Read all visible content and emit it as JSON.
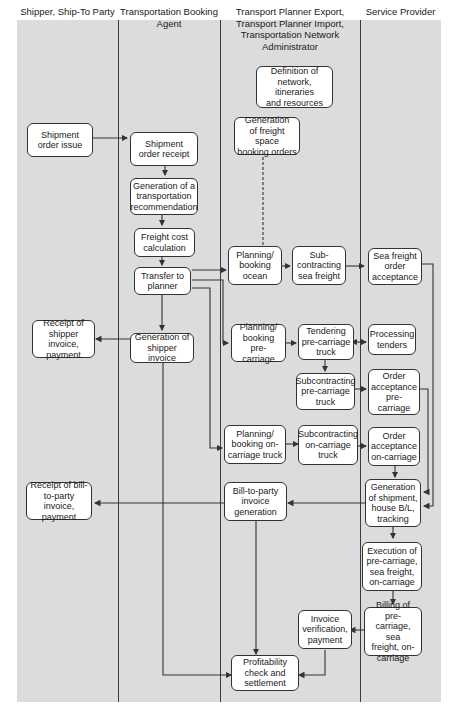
{
  "lanes": [
    {
      "id": "shipper",
      "title": "Shipper, Ship-To Party"
    },
    {
      "id": "booking_agent",
      "title": "Transportation Booking\nAgent"
    },
    {
      "id": "planner",
      "title": "Transport Planner Export,\nTransport Planner Import,\nTransportation Network Administrator"
    },
    {
      "id": "service_provider",
      "title": "Service Provider"
    }
  ],
  "nodes": {
    "definition_network": "Definition of\nnetwork, itineraries\nand resources",
    "shipment_order_issue": "Shipment\norder issue",
    "shipment_order_receipt": "Shipment\norder receipt",
    "generation_freight_space": "Generation\nof freight space\nbooking orders",
    "generation_transport_rec": "Generation of a\ntransportation\nrecommendation",
    "freight_cost_calc": "Freight cost\ncalculation",
    "transfer_to_planner": "Transfer to\nplanner",
    "planning_booking_ocean": "Planning/\nbooking\nocean",
    "subcontracting_sea": "Sub-\ncontracting\nsea freight",
    "sea_freight_acceptance": "Sea freight\norder\nacceptance",
    "receipt_shipper_invoice": "Receipt of\nshipper invoice,\npayment",
    "generation_shipper_invoice": "Generation of\nshipper invoice",
    "planning_booking_pre": "Planning/\nbooking pre-\ncarriage",
    "tendering_pre": "Tendering\npre-carriage\ntruck",
    "processing_tenders": "Processing\ntenders",
    "subcontracting_pre": "Subcontracting\npre-carriage\ntruck",
    "order_acceptance_pre": "Order\nacceptance\npre-carriage",
    "planning_booking_on": "Planning/\nbooking on-\ncarriage truck",
    "subcontracting_on": "Subcontracting\non-carriage\ntruck",
    "order_acceptance_on": "Order\nacceptance\non-carriage",
    "receipt_bill_to_party": "Receipt of bill-\nto-party invoice,\npayment",
    "bill_to_party_generation": "Bill-to-party\ninvoice\ngeneration",
    "generation_shipment_bl": "Generation\nof shipment,\nhouse B/L,\ntracking",
    "execution_carriage": "Execution of\npre-carriage,\nsea freight,\non-carriage",
    "billing_carriage": "Billing of pre-\ncarriage, sea\nfreight, on-\ncarriage",
    "invoice_verification": "Invoice\nverification,\npayment",
    "profitability_check": "Profitability\ncheck and\nsettlement"
  },
  "colors": {
    "background": "#dcdcdc",
    "node_fill": "#ffffff",
    "line": "#333333"
  }
}
